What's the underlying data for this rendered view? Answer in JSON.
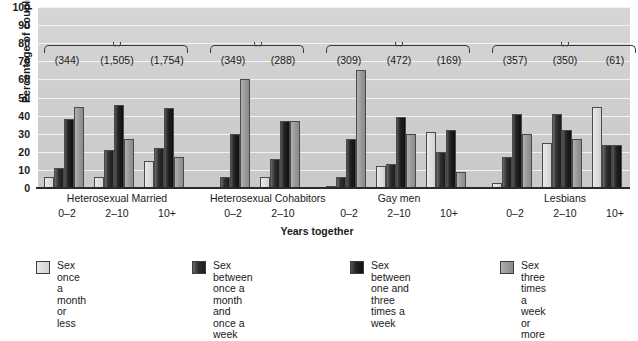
{
  "chart_data": {
    "type": "bar",
    "title": "",
    "xlabel": "Years together",
    "ylabel": "Percentage of couples",
    "ylim": [
      0,
      100
    ],
    "yticks": [
      0,
      10,
      20,
      30,
      40,
      50,
      60,
      70,
      80,
      90,
      100
    ],
    "grid": true,
    "legend_position": "bottom",
    "group_labels": [
      "Heterosexual Married",
      "Heterosexual Cohabitors",
      "Gay men",
      "Lesbians"
    ],
    "categories": [
      "0–2",
      "2–10",
      "10+",
      "0–2",
      "2–10",
      "0–2",
      "2–10",
      "10+",
      "0–2",
      "2–10",
      "10+"
    ],
    "sample_sizes": [
      "(344)",
      "(1,505)",
      "(1,754)",
      "(349)",
      "(288)",
      "(309)",
      "(472)",
      "(169)",
      "(357)",
      "(350)",
      "(61)"
    ],
    "series": [
      {
        "name": "Sex once a month or less",
        "color": "#dcdcdc",
        "values": [
          6,
          6,
          15,
          0,
          6,
          1,
          12,
          31,
          3,
          25,
          45
        ]
      },
      {
        "name": "Sex between once a month and once a week",
        "color": "#222222",
        "values": [
          11,
          21,
          22,
          6,
          16,
          6,
          13,
          20,
          17,
          41,
          24
        ]
      },
      {
        "name": "Sex between one and three times a week",
        "color": "#151515",
        "values": [
          38,
          46,
          44,
          30,
          37,
          27,
          39,
          32,
          41,
          32,
          24
        ]
      },
      {
        "name": "Sex three times a week or more",
        "color": "#9a9a9a",
        "values": [
          45,
          27,
          17,
          60,
          37,
          65,
          30,
          9,
          30,
          27,
          0
        ]
      }
    ]
  },
  "axis": {
    "ylabel": "Percentage of couples",
    "xlabel": "Years together"
  },
  "legend": [
    {
      "label": "Sex once a\nmonth or less",
      "swatch": "s0"
    },
    {
      "label": "Sex between once a\nmonth and once a week",
      "swatch": "s1"
    },
    {
      "label": "Sex between one and\nthree times a week",
      "swatch": "s2"
    },
    {
      "label": "Sex three times a\nweek or more",
      "swatch": "s3"
    }
  ]
}
